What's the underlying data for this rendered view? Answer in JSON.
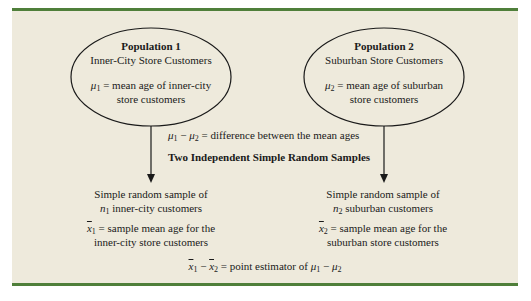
{
  "population1": {
    "title": "Population 1",
    "subtitle": "Inner-City Store Customers",
    "param_symbol": "μ",
    "param_sub": "1",
    "param_text": " = mean age of inner-city",
    "param_text2": "store customers"
  },
  "population2": {
    "title": "Population 2",
    "subtitle": "Suburban Store Customers",
    "param_symbol": "μ",
    "param_sub": "2",
    "param_text": " = mean age of suburban",
    "param_text2": "store customers"
  },
  "difference": {
    "sym_a": "μ",
    "sub_a": "1",
    "minus": " − ",
    "sym_b": "μ",
    "sub_b": "2",
    "text": " = difference between the mean ages"
  },
  "samples_heading": "Two Independent Simple Random Samples",
  "sample1": {
    "line1": "Simple random sample of",
    "n_symbol": "n",
    "n_sub": "1",
    "line2_rest": " inner-city customers",
    "xbar_symbol": "x",
    "xbar_sub": "1",
    "line3_rest": " = sample mean age for the",
    "line4": "inner-city store customers"
  },
  "sample2": {
    "line1": "Simple random sample of",
    "n_symbol": "n",
    "n_sub": "2",
    "line2_rest": " suburban customers",
    "xbar_symbol": "x",
    "xbar_sub": "2",
    "line3_rest": " = sample mean age for the",
    "line4": "suburban store customers"
  },
  "estimator": {
    "x1": "x",
    "x1_sub": "1",
    "minus": " − ",
    "x2": "x",
    "x2_sub": "2",
    "text": " = point estimator of ",
    "mu1": "μ",
    "mu1_sub": "1",
    "minus2": " − ",
    "mu2": "μ",
    "mu2_sub": "2"
  },
  "colors": {
    "panel_background": "#eeeadc",
    "rule_green": "#4f7f3a",
    "ink": "#1a1a1a"
  }
}
